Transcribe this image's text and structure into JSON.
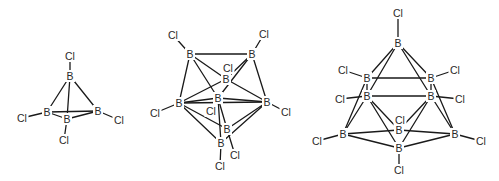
{
  "figure": {
    "structures": [
      {
        "name": "B4Cl4",
        "atoms": [
          {
            "id": "b1",
            "el": "B",
            "x": 70,
            "y": 76
          },
          {
            "id": "b2",
            "el": "B",
            "x": 47,
            "y": 112
          },
          {
            "id": "b3",
            "el": "B",
            "x": 67,
            "y": 119
          },
          {
            "id": "b4",
            "el": "B",
            "x": 98,
            "y": 111
          },
          {
            "id": "c1",
            "el": "Cl",
            "x": 70,
            "y": 56
          },
          {
            "id": "c2",
            "el": "Cl",
            "x": 22,
            "y": 118
          },
          {
            "id": "c3",
            "el": "Cl",
            "x": 64,
            "y": 140
          },
          {
            "id": "c4",
            "el": "Cl",
            "x": 119,
            "y": 120
          }
        ],
        "bonds": [
          [
            "b1",
            "b2"
          ],
          [
            "b1",
            "b3"
          ],
          [
            "b1",
            "b4"
          ],
          [
            "b2",
            "b3"
          ],
          [
            "b2",
            "b4"
          ],
          [
            "b3",
            "b4"
          ],
          [
            "b1",
            "c1"
          ],
          [
            "b2",
            "c2"
          ],
          [
            "b3",
            "c3"
          ],
          [
            "b4",
            "c4"
          ]
        ]
      },
      {
        "name": "B8Cl8",
        "atoms": [
          {
            "id": "b1",
            "el": "B",
            "x": 190,
            "y": 54
          },
          {
            "id": "b2",
            "el": "B",
            "x": 252,
            "y": 54
          },
          {
            "id": "b3",
            "el": "B",
            "x": 226,
            "y": 79
          },
          {
            "id": "b4",
            "el": "B",
            "x": 179,
            "y": 103
          },
          {
            "id": "b5",
            "el": "B",
            "x": 218,
            "y": 98
          },
          {
            "id": "b6",
            "el": "B",
            "x": 267,
            "y": 102
          },
          {
            "id": "b7",
            "el": "B",
            "x": 227,
            "y": 129
          },
          {
            "id": "b8",
            "el": "B",
            "x": 221,
            "y": 143
          },
          {
            "id": "c1",
            "el": "Cl",
            "x": 173,
            "y": 35
          },
          {
            "id": "c2",
            "el": "Cl",
            "x": 264,
            "y": 34
          },
          {
            "id": "c3",
            "el": "Cl",
            "x": 228,
            "y": 68
          },
          {
            "id": "c4",
            "el": "Cl",
            "x": 155,
            "y": 113
          },
          {
            "id": "c5",
            "el": "Cl",
            "x": 211,
            "y": 111
          },
          {
            "id": "c6",
            "el": "Cl",
            "x": 286,
            "y": 112
          },
          {
            "id": "c7",
            "el": "Cl",
            "x": 235,
            "y": 155
          },
          {
            "id": "c8",
            "el": "Cl",
            "x": 220,
            "y": 166
          }
        ],
        "bonds": [
          [
            "b1",
            "b2"
          ],
          [
            "b1",
            "b3"
          ],
          [
            "b1",
            "b4"
          ],
          [
            "b1",
            "b5"
          ],
          [
            "b2",
            "b3"
          ],
          [
            "b2",
            "b5"
          ],
          [
            "b2",
            "b6"
          ],
          [
            "b3",
            "b4"
          ],
          [
            "b3",
            "b6"
          ],
          [
            "b4",
            "b5"
          ],
          [
            "b4",
            "b6"
          ],
          [
            "b4",
            "b7"
          ],
          [
            "b4",
            "b8"
          ],
          [
            "b5",
            "b6"
          ],
          [
            "b5",
            "b7"
          ],
          [
            "b5",
            "b8"
          ],
          [
            "b6",
            "b7"
          ],
          [
            "b6",
            "b8"
          ],
          [
            "b1",
            "c1"
          ],
          [
            "b2",
            "c2"
          ],
          [
            "b4",
            "c4"
          ],
          [
            "b6",
            "c6"
          ],
          [
            "b8",
            "c8"
          ],
          [
            "b7",
            "c7"
          ]
        ]
      },
      {
        "name": "B9Cl9",
        "atoms": [
          {
            "id": "b1",
            "el": "B",
            "x": 398,
            "y": 43
          },
          {
            "id": "b2",
            "el": "B",
            "x": 367,
            "y": 78
          },
          {
            "id": "b3",
            "el": "B",
            "x": 431,
            "y": 78
          },
          {
            "id": "b4",
            "el": "B",
            "x": 367,
            "y": 96
          },
          {
            "id": "b5",
            "el": "B",
            "x": 431,
            "y": 96
          },
          {
            "id": "b6",
            "el": "B",
            "x": 343,
            "y": 134
          },
          {
            "id": "b7",
            "el": "B",
            "x": 399,
            "y": 130
          },
          {
            "id": "b8",
            "el": "B",
            "x": 455,
            "y": 134
          },
          {
            "id": "b9",
            "el": "B",
            "x": 399,
            "y": 148
          },
          {
            "id": "c1",
            "el": "Cl",
            "x": 398,
            "y": 13
          },
          {
            "id": "c2",
            "el": "Cl",
            "x": 343,
            "y": 70
          },
          {
            "id": "c3",
            "el": "Cl",
            "x": 455,
            "y": 70
          },
          {
            "id": "c4",
            "el": "Cl",
            "x": 340,
            "y": 99
          },
          {
            "id": "c5",
            "el": "Cl",
            "x": 460,
            "y": 99
          },
          {
            "id": "c6",
            "el": "Cl",
            "x": 317,
            "y": 141
          },
          {
            "id": "c7",
            "el": "Cl",
            "x": 400,
            "y": 120
          },
          {
            "id": "c8",
            "el": "Cl",
            "x": 481,
            "y": 141
          },
          {
            "id": "c9",
            "el": "Cl",
            "x": 399,
            "y": 170
          }
        ],
        "bonds": [
          [
            "b1",
            "b2"
          ],
          [
            "b1",
            "b3"
          ],
          [
            "b1",
            "b4"
          ],
          [
            "b1",
            "b5"
          ],
          [
            "b2",
            "b3"
          ],
          [
            "b4",
            "b5"
          ],
          [
            "b2",
            "b4"
          ],
          [
            "b3",
            "b5"
          ],
          [
            "b2",
            "b6"
          ],
          [
            "b4",
            "b6"
          ],
          [
            "b3",
            "b8"
          ],
          [
            "b5",
            "b8"
          ],
          [
            "b4",
            "b9"
          ],
          [
            "b5",
            "b9"
          ],
          [
            "b4",
            "b7"
          ],
          [
            "b5",
            "b7"
          ],
          [
            "b6",
            "b7"
          ],
          [
            "b6",
            "b9"
          ],
          [
            "b7",
            "b8"
          ],
          [
            "b8",
            "b9"
          ],
          [
            "b1",
            "c1"
          ],
          [
            "b2",
            "c2"
          ],
          [
            "b3",
            "c3"
          ],
          [
            "b4",
            "c4"
          ],
          [
            "b5",
            "c5"
          ],
          [
            "b6",
            "c6"
          ],
          [
            "b8",
            "c8"
          ],
          [
            "b9",
            "c9"
          ]
        ]
      }
    ]
  }
}
